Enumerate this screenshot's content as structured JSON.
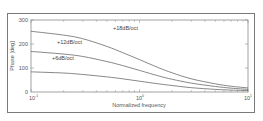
{
  "chart_data": {
    "type": "line",
    "title": "",
    "xlabel": "Normalized frequency",
    "ylabel": "Phase [deg]",
    "xscale": "log",
    "xlim": [
      0.1,
      10
    ],
    "ylim": [
      0,
      300
    ],
    "xticks": [
      {
        "value": 0.1,
        "base": "10",
        "exp": "-1"
      },
      {
        "value": 1,
        "base": "10",
        "exp": "0"
      },
      {
        "value": 10,
        "base": "10",
        "exp": "1"
      }
    ],
    "yticks": [
      0,
      100,
      200,
      300
    ],
    "grid": false,
    "legend": "inline annotations",
    "x": [
      0.1,
      0.2,
      0.3,
      0.5,
      0.7,
      1.0,
      1.5,
      2,
      3,
      5,
      7,
      10
    ],
    "series": [
      {
        "name": "+18dB/oct",
        "values": [
          253,
          237,
          222,
          190,
          164,
          135,
          101,
          80,
          55,
          34,
          24,
          17
        ]
      },
      {
        "name": "+12dB/oct",
        "values": [
          169,
          158,
          148,
          127,
          110,
          90,
          67,
          53,
          37,
          23,
          16,
          11
        ]
      },
      {
        "name": "+6dB/oct",
        "values": [
          84,
          79,
          73,
          63,
          55,
          45,
          34,
          27,
          18,
          11,
          8,
          6
        ]
      }
    ],
    "annotations": [
      {
        "text": "+18dB/oct",
        "x": 1.0,
        "y": 263
      },
      {
        "text": "+12dB/oct",
        "x": 0.2,
        "y": 205
      },
      {
        "text": "+6dB/oct",
        "x": 0.2,
        "y": 137
      }
    ]
  },
  "labels": {
    "xlabel": "Normalized frequency",
    "ylabel": "Phase [deg]",
    "y0": "0",
    "y100": "100",
    "y200": "200",
    "y300": "300",
    "x0_base": "10",
    "x0_exp": "-1",
    "x1_base": "10",
    "x1_exp": "0",
    "x2_base": "10",
    "x2_exp": "1",
    "s18": "+18dB/oct",
    "s12": "+12dB/oct",
    "s6": "+6dB/oct"
  }
}
